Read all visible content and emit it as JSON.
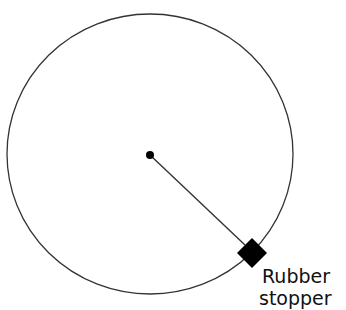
{
  "diagram": {
    "type": "circular-motion",
    "colors": {
      "background": "#ffffff",
      "circle_stroke": "#333333",
      "string_stroke": "#333333",
      "stopper_fill": "#000000",
      "center_fill": "#000000",
      "text": "#111111"
    },
    "circle": {
      "cx": 150,
      "cy": 154,
      "rx": 143,
      "ry": 140
    },
    "center_point": {
      "cx": 150,
      "cy": 155,
      "r": 4
    },
    "string": {
      "x1": 150,
      "y1": 155,
      "x2": 245,
      "y2": 245
    },
    "stopper": {
      "cx": 252,
      "cy": 253,
      "half_diagonal": 15
    },
    "labels": {
      "stopper_line1": "Rubber",
      "stopper_line2": "stopper"
    }
  }
}
